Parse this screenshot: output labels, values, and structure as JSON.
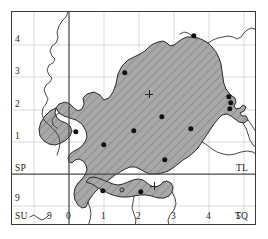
{
  "figure": {
    "kind": "grid-reference-distribution-map",
    "frame": {
      "x": 11,
      "y": 11,
      "width": 245,
      "height": 214
    },
    "background_color": "#ffffff",
    "neatline_color": "#3a3a3a"
  },
  "grid": {
    "minor_line_color": "#c9c9c9",
    "major_line_color": "#555555",
    "major_vertical_x": 68,
    "major_horizontal_y": 173,
    "minor_vertical_x": [
      103,
      138,
      173,
      208,
      243
    ],
    "minor_horizontal_y": [
      44,
      76,
      109,
      141,
      205
    ],
    "spacing_px": 34.8
  },
  "axes": {
    "left_labels": [
      {
        "text": "4",
        "x": 15,
        "y": 36
      },
      {
        "text": "3",
        "x": 15,
        "y": 68
      },
      {
        "text": "2",
        "x": 15,
        "y": 101
      },
      {
        "text": "1",
        "x": 15,
        "y": 133
      },
      {
        "text": "SP",
        "x": 15,
        "y": 165
      },
      {
        "text": "9",
        "x": 15,
        "y": 196
      },
      {
        "text": "SU",
        "x": 15,
        "y": 214
      }
    ],
    "bottom_labels": [
      {
        "text": "9",
        "x": 48,
        "y": 214
      },
      {
        "text": "0",
        "x": 66,
        "y": 214
      },
      {
        "text": "1",
        "x": 101,
        "y": 214
      },
      {
        "text": "2",
        "x": 136,
        "y": 214
      },
      {
        "text": "3",
        "x": 171,
        "y": 214
      },
      {
        "text": "4",
        "x": 206,
        "y": 214
      },
      {
        "text": "5",
        "x": 238,
        "y": 214
      }
    ],
    "sheet_labels": [
      {
        "text": "TL",
        "x": 237,
        "y": 165
      },
      {
        "text": "TQ",
        "x": 236,
        "y": 214
      }
    ]
  },
  "legend_semantics": {
    "shaded_region": "study-area-hatched",
    "filled_dot": "recorded-site",
    "open_circle": "unconfirmed-site",
    "cross": "reference-point"
  },
  "symbols": {
    "filled_dots": [
      {
        "x": 193,
        "y": 35
      },
      {
        "x": 124,
        "y": 72
      },
      {
        "x": 228,
        "y": 96
      },
      {
        "x": 230,
        "y": 102
      },
      {
        "x": 229,
        "y": 108
      },
      {
        "x": 161,
        "y": 116
      },
      {
        "x": 133,
        "y": 130
      },
      {
        "x": 190,
        "y": 128
      },
      {
        "x": 103,
        "y": 144
      },
      {
        "x": 164,
        "y": 159
      },
      {
        "x": 102,
        "y": 190
      },
      {
        "x": 140,
        "y": 191
      },
      {
        "x": 75,
        "y": 131
      }
    ],
    "open_circles": [
      {
        "x": 121,
        "y": 189
      }
    ],
    "crosses": [
      {
        "x": 148,
        "y": 93
      },
      {
        "x": 153,
        "y": 185
      }
    ]
  },
  "region_fill": {
    "base_color": "#a8a8a8",
    "hatch_color": "#8a8a8a",
    "outline_color": "#2b2b2b"
  },
  "coastline": {
    "stroke_color": "#3f3f3f"
  }
}
